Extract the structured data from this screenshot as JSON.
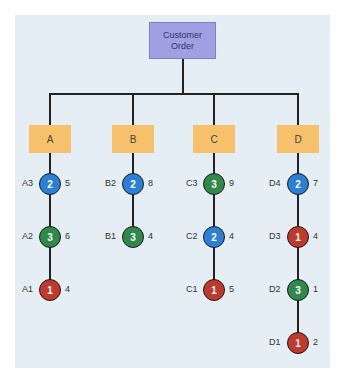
{
  "diagram": {
    "root": {
      "line1": "Customer",
      "line2": "Order"
    },
    "colors": {
      "1": "#c0392b",
      "2": "#2a7fd6",
      "3": "#2f8a4a",
      "box": "#f7c06a",
      "root": "#9f9fe3",
      "panel": "#e4eef4"
    },
    "branches": [
      {
        "label": "A",
        "nodes": [
          {
            "name": "A3",
            "level": "2",
            "value": "5"
          },
          {
            "name": "A2",
            "level": "3",
            "value": "6"
          },
          {
            "name": "A1",
            "level": "1",
            "value": "4"
          }
        ]
      },
      {
        "label": "B",
        "nodes": [
          {
            "name": "B2",
            "level": "2",
            "value": "8"
          },
          {
            "name": "B1",
            "level": "3",
            "value": "4"
          }
        ]
      },
      {
        "label": "C",
        "nodes": [
          {
            "name": "C3",
            "level": "3",
            "value": "9"
          },
          {
            "name": "C2",
            "level": "2",
            "value": "4"
          },
          {
            "name": "C1",
            "level": "1",
            "value": "5"
          }
        ]
      },
      {
        "label": "D",
        "nodes": [
          {
            "name": "D4",
            "level": "2",
            "value": "7"
          },
          {
            "name": "D3",
            "level": "1",
            "value": "4"
          },
          {
            "name": "D2",
            "level": "3",
            "value": "1"
          },
          {
            "name": "D1",
            "level": "1",
            "value": "2"
          }
        ]
      }
    ]
  }
}
